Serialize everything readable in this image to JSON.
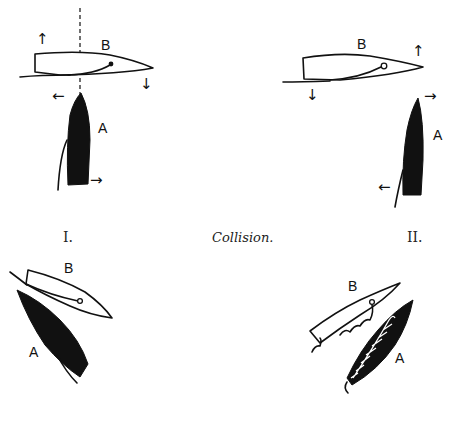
{
  "figure": {
    "caption": "Collision.",
    "panels": [
      {
        "id": "I",
        "label": "I.",
        "boats": [
          {
            "name": "B",
            "label": "B",
            "hull": "white"
          },
          {
            "name": "A",
            "label": "A",
            "hull": "black"
          }
        ],
        "arrows": [
          "up",
          "down",
          "left",
          "right"
        ],
        "has_dashed_line": true
      },
      {
        "id": "II",
        "label": "II.",
        "boats": [
          {
            "name": "B",
            "label": "B",
            "hull": "white"
          },
          {
            "name": "A",
            "label": "A",
            "hull": "black"
          }
        ],
        "arrows": [
          "up",
          "down",
          "right",
          "left"
        ]
      },
      {
        "id": "III",
        "label": "",
        "boats": [
          {
            "name": "B",
            "label": "B",
            "hull": "white"
          },
          {
            "name": "A",
            "label": "A",
            "hull": "black"
          }
        ]
      },
      {
        "id": "IV",
        "label": "",
        "boats": [
          {
            "name": "B",
            "label": "B",
            "hull": "white"
          },
          {
            "name": "A",
            "label": "A",
            "hull": "black-hatched"
          }
        ]
      }
    ]
  },
  "colors": {
    "ink": "#111111",
    "background": "#ffffff"
  }
}
